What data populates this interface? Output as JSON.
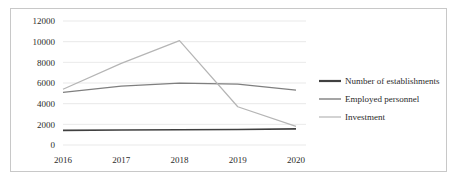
{
  "chart_data": {
    "type": "line",
    "title": "",
    "subtitle": "",
    "xlabel": "",
    "ylabel": "",
    "categories": [
      "2016",
      "2017",
      "2018",
      "2019",
      "2020"
    ],
    "x_tick_labels": [
      "2016",
      "2017",
      "2018",
      "2019",
      "2020"
    ],
    "y_tick_labels": [
      "0",
      "2000",
      "4000",
      "6000",
      "8000",
      "10000",
      "12000"
    ],
    "ylim": [
      0,
      12000
    ],
    "y_tick_step": 2000,
    "grid": "horizontal",
    "legend_position": "right",
    "series": [
      {
        "name": "Number of establishments",
        "color": "#404040",
        "width": 1.6,
        "values": [
          1420,
          1450,
          1480,
          1500,
          1560
        ]
      },
      {
        "name": "Employed personnel",
        "color": "#7f7f7f",
        "width": 1.2,
        "values": [
          5100,
          5700,
          5980,
          5900,
          5320
        ]
      },
      {
        "name": "Investment",
        "color": "#b5b5b5",
        "width": 1.2,
        "values": [
          5400,
          7900,
          10100,
          3700,
          1800
        ]
      }
    ]
  },
  "legend": {
    "entries": [
      {
        "label": "Number of establishments",
        "color": "#404040",
        "width": 2.2
      },
      {
        "label": "Employed personnel",
        "color": "#7f7f7f",
        "width": 1.4
      },
      {
        "label": "Investment",
        "color": "#b5b5b5",
        "width": 1.2
      }
    ]
  },
  "colors": {
    "border": "#c8c8c8",
    "gridline": "#e3e3e3",
    "text": "#2b2b2b",
    "background": "#ffffff"
  }
}
